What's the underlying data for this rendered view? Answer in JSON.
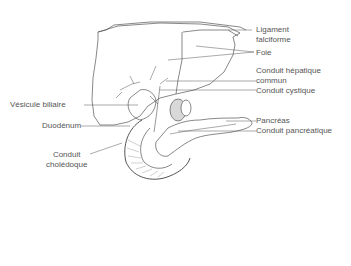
{
  "diagram": {
    "labels": {
      "ligament_1": "Ligament",
      "ligament_2": "falciforme",
      "foie": "Foie",
      "hepatique_1": "Conduit hépatique",
      "hepatique_2": "commun",
      "cystique": "Conduit cystique",
      "pancreas": "Pancréas",
      "pancreatique": "Conduit pancréatique",
      "vesicule": "Vésicule biliaire",
      "duodenum": "Duodénum",
      "choledoque_1": "Conduit",
      "choledoque_2": "cholédoque"
    },
    "colors": {
      "line": "#555555",
      "text": "#555555",
      "shade": "#888888"
    }
  }
}
